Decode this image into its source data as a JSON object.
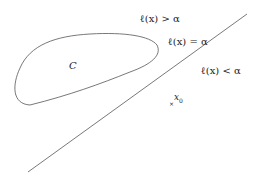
{
  "diagram": {
    "set_label": "C",
    "region_above": "ℓ(x) > α",
    "boundary": "ℓ(x) = α",
    "region_below": "ℓ(x) < α",
    "point_label": "x",
    "point_subscript": "0",
    "point_marker": "×",
    "stroke_color": "#555555"
  }
}
